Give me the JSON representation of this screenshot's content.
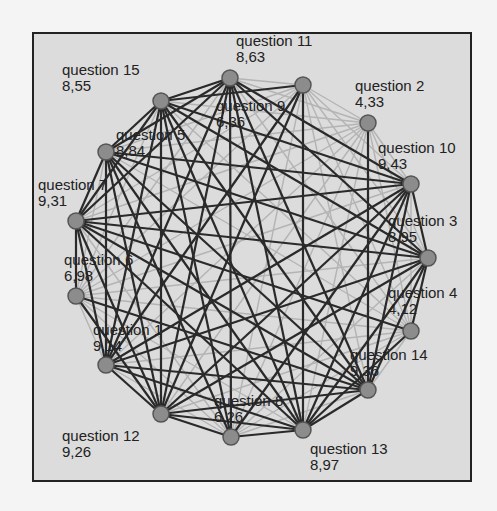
{
  "chart_data": {
    "type": "network",
    "title": "",
    "layout": "circular",
    "nodes": [
      {
        "id": "q11",
        "label": "question 11",
        "value": "8,63",
        "x": 230,
        "y": 78,
        "lx": 236,
        "ly": 33
      },
      {
        "id": "q9",
        "label": "question 9",
        "value": "6,36",
        "x": 303,
        "y": 85,
        "lx": 216,
        "ly": 98
      },
      {
        "id": "q2",
        "label": "question 2",
        "value": "4,33",
        "x": 368,
        "y": 123,
        "lx": 355,
        "ly": 78
      },
      {
        "id": "q10",
        "label": "question 10",
        "value": "9,43",
        "x": 411,
        "y": 184,
        "lx": 378,
        "ly": 140
      },
      {
        "id": "q3",
        "label": "question 3",
        "value": "8,95",
        "x": 428,
        "y": 258,
        "lx": 388,
        "ly": 213
      },
      {
        "id": "q4",
        "label": "question 4",
        "value": "4,12",
        "x": 411,
        "y": 331,
        "lx": 388,
        "ly": 285
      },
      {
        "id": "q14",
        "label": "question 14",
        "value": "9,36",
        "x": 368,
        "y": 390,
        "lx": 350,
        "ly": 347
      },
      {
        "id": "q13",
        "label": "question 13",
        "value": "8,97",
        "x": 303,
        "y": 430,
        "lx": 310,
        "ly": 441
      },
      {
        "id": "q8",
        "label": "question 8",
        "value": "6,26",
        "x": 231,
        "y": 437,
        "lx": 214,
        "ly": 393
      },
      {
        "id": "q12",
        "label": "question 12",
        "value": "9,26",
        "x": 161,
        "y": 414,
        "lx": 62,
        "ly": 428
      },
      {
        "id": "q1",
        "label": "question 1",
        "value": "9,14",
        "x": 106,
        "y": 365,
        "lx": 93,
        "ly": 322
      },
      {
        "id": "q6",
        "label": "question 6",
        "value": "6,98",
        "x": 76,
        "y": 296,
        "lx": 64,
        "ly": 252
      },
      {
        "id": "q7",
        "label": "question 7",
        "value": "9,31",
        "x": 76,
        "y": 221,
        "lx": 38,
        "ly": 177
      },
      {
        "id": "q5",
        "label": "question 5",
        "value": "8,84",
        "x": 106,
        "y": 152,
        "lx": 116,
        "ly": 127
      },
      {
        "id": "q15",
        "label": "question 15",
        "value": "8,55",
        "x": 161,
        "y": 101,
        "lx": 62,
        "ly": 62
      }
    ],
    "strong_edges": [
      [
        "q11",
        "q15"
      ],
      [
        "q11",
        "q5"
      ],
      [
        "q11",
        "q7"
      ],
      [
        "q11",
        "q1"
      ],
      [
        "q11",
        "q12"
      ],
      [
        "q11",
        "q13"
      ],
      [
        "q11",
        "q14"
      ],
      [
        "q11",
        "q3"
      ],
      [
        "q11",
        "q10"
      ],
      [
        "q11",
        "q8"
      ],
      [
        "q9",
        "q12"
      ],
      [
        "q9",
        "q1"
      ],
      [
        "q9",
        "q15"
      ],
      [
        "q9",
        "q13"
      ],
      [
        "q2",
        "q14"
      ],
      [
        "q10",
        "q15"
      ],
      [
        "q10",
        "q5"
      ],
      [
        "q10",
        "q7"
      ],
      [
        "q10",
        "q1"
      ],
      [
        "q10",
        "q12"
      ],
      [
        "q10",
        "q13"
      ],
      [
        "q10",
        "q14"
      ],
      [
        "q10",
        "q3"
      ],
      [
        "q10",
        "q8"
      ],
      [
        "q3",
        "q15"
      ],
      [
        "q3",
        "q5"
      ],
      [
        "q3",
        "q7"
      ],
      [
        "q3",
        "q1"
      ],
      [
        "q3",
        "q12"
      ],
      [
        "q3",
        "q13"
      ],
      [
        "q3",
        "q14"
      ],
      [
        "q4",
        "q13"
      ],
      [
        "q4",
        "q7"
      ],
      [
        "q4",
        "q3"
      ],
      [
        "q14",
        "q15"
      ],
      [
        "q14",
        "q5"
      ],
      [
        "q14",
        "q7"
      ],
      [
        "q14",
        "q1"
      ],
      [
        "q14",
        "q12"
      ],
      [
        "q14",
        "q13"
      ],
      [
        "q14",
        "q6"
      ],
      [
        "q13",
        "q15"
      ],
      [
        "q13",
        "q5"
      ],
      [
        "q13",
        "q7"
      ],
      [
        "q13",
        "q1"
      ],
      [
        "q13",
        "q12"
      ],
      [
        "q13",
        "q8"
      ],
      [
        "q12",
        "q15"
      ],
      [
        "q12",
        "q5"
      ],
      [
        "q12",
        "q7"
      ],
      [
        "q12",
        "q1"
      ],
      [
        "q12",
        "q8"
      ],
      [
        "q12",
        "q6"
      ],
      [
        "q1",
        "q15"
      ],
      [
        "q1",
        "q5"
      ],
      [
        "q1",
        "q7"
      ],
      [
        "q7",
        "q15"
      ],
      [
        "q7",
        "q5"
      ],
      [
        "q7",
        "q6"
      ],
      [
        "q5",
        "q15"
      ],
      [
        "q5",
        "q8"
      ],
      [
        "q15",
        "q8"
      ]
    ],
    "weak_edges_note": "all remaining pairs drawn as light gray lines"
  }
}
